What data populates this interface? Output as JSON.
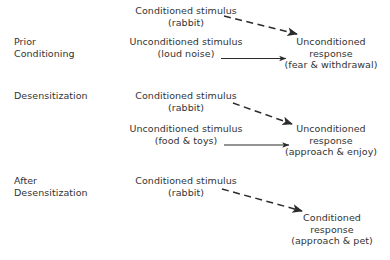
{
  "diagram": {
    "text_color": "#333333",
    "arrow_color": "#2b2b2b",
    "background": "#ffffff",
    "stages": [
      {
        "id": "prior-conditioning",
        "label_line1": "Prior",
        "label_line2": "Conditioning",
        "cs_line1": "Conditioned stimulus",
        "cs_line2": "(rabbit)",
        "us_line1": "Unconditioned stimulus",
        "us_line2": "(loud noise)",
        "response_line1": "Unconditioned",
        "response_line2": "response",
        "response_line3": "(fear & withdrawal)"
      },
      {
        "id": "desensitization",
        "label_line1": "Desensitization",
        "label_line2": "",
        "cs_line1": "Conditioned stimulus",
        "cs_line2": "(rabbit)",
        "us_line1": "Unconditioned stimulus",
        "us_line2": "(food & toys)",
        "response_line1": "Unconditioned",
        "response_line2": "response",
        "response_line3": "(approach & enjoy)"
      },
      {
        "id": "after-desensitization",
        "label_line1": "After",
        "label_line2": "Desensitization",
        "cs_line1": "Conditioned stimulus",
        "cs_line2": "(rabbit)",
        "response_line1": "Conditioned",
        "response_line2": "response",
        "response_line3": "(approach & pet)"
      }
    ],
    "arrows": [
      {
        "id": "cs-to-ur-1",
        "style": "dashed"
      },
      {
        "id": "us-to-ur-1",
        "style": "solid"
      },
      {
        "id": "cs-to-ur-2",
        "style": "dashed"
      },
      {
        "id": "us-to-ur-2",
        "style": "solid"
      },
      {
        "id": "cs-to-cr-3",
        "style": "dashed"
      }
    ]
  }
}
